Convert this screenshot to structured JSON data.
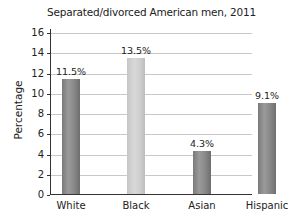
{
  "chart_data": {
    "type": "bar",
    "title": "Separated/divorced American men, 2011",
    "xlabel": "",
    "ylabel": "Percentage",
    "categories": [
      "White",
      "Black",
      "Asian",
      "Hispanic"
    ],
    "values": [
      11.5,
      13.5,
      4.3,
      9.1
    ],
    "value_labels": [
      "11.5%",
      "13.5%",
      "4.3%",
      "9.1%"
    ],
    "bar_colors": [
      "#8a8a8a",
      "#d0d0d0",
      "#8a8a8a",
      "#8a8a8a"
    ],
    "ylim": [
      0,
      16
    ],
    "yticks": [
      "0",
      "2",
      "4",
      "6",
      "8",
      "10",
      "12",
      "14",
      "16"
    ],
    "grid": true,
    "legend": null
  }
}
